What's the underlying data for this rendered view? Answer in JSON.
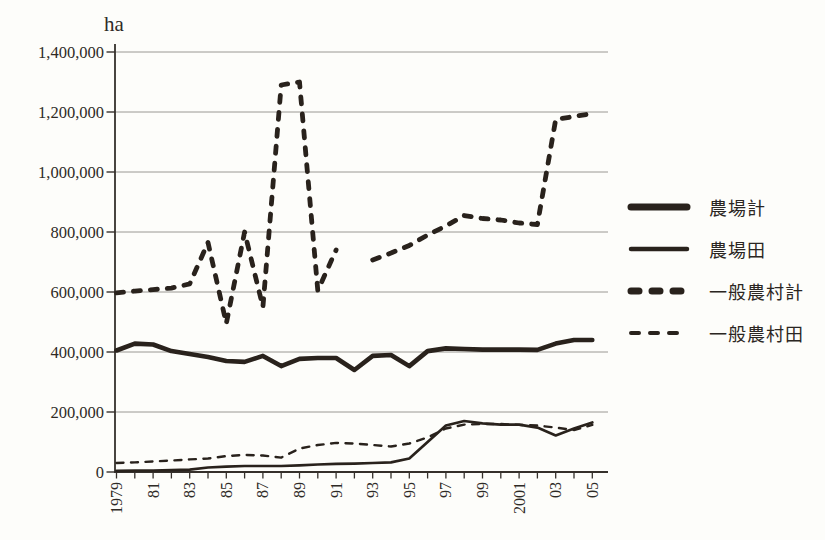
{
  "figure": {
    "unit_label": "ha"
  },
  "colors": {
    "line": "#29221c",
    "grid": "#8f8c88",
    "axis": "#35302b",
    "text": "#2e2a26",
    "background": "#fdfdfa"
  },
  "chart_data": {
    "type": "line",
    "title": "",
    "unit_label": "ha",
    "grid": "horizontal-only",
    "legend_position": "right",
    "ylim": [
      0,
      1400000
    ],
    "x": [
      1979,
      1980,
      1981,
      1982,
      1983,
      1984,
      1985,
      1986,
      1987,
      1988,
      1989,
      1990,
      1991,
      1992,
      1993,
      1994,
      1995,
      1996,
      1997,
      1998,
      1999,
      2000,
      2001,
      2002,
      2003,
      2004,
      2005
    ],
    "x_labeled_ticks": [
      {
        "year": 1979,
        "label": "1979"
      },
      {
        "year": 1981,
        "label": "81"
      },
      {
        "year": 1983,
        "label": "83"
      },
      {
        "year": 1985,
        "label": "85"
      },
      {
        "year": 1987,
        "label": "87"
      },
      {
        "year": 1989,
        "label": "89"
      },
      {
        "year": 1991,
        "label": "91"
      },
      {
        "year": 1993,
        "label": "93"
      },
      {
        "year": 1995,
        "label": "95"
      },
      {
        "year": 1997,
        "label": "97"
      },
      {
        "year": 1999,
        "label": "99"
      },
      {
        "year": 2001,
        "label": "2001"
      },
      {
        "year": 2003,
        "label": "03"
      },
      {
        "year": 2005,
        "label": "05"
      }
    ],
    "y_ticks": [
      {
        "value": 0,
        "label": "0"
      },
      {
        "value": 200000,
        "label": "200,000"
      },
      {
        "value": 400000,
        "label": "400,000"
      },
      {
        "value": 600000,
        "label": "600,000"
      },
      {
        "value": 800000,
        "label": "800,000"
      },
      {
        "value": 1000000,
        "label": "1,000,000"
      },
      {
        "value": 1200000,
        "label": "1,200,000"
      },
      {
        "value": 1400000,
        "label": "1,400,000"
      }
    ],
    "series": [
      {
        "id": "farm-total",
        "name": "農場計",
        "style": "solid-thick",
        "values": [
          405000,
          428000,
          425000,
          403000,
          393000,
          383000,
          370000,
          367000,
          387000,
          353000,
          377000,
          380000,
          380000,
          340000,
          387000,
          390000,
          353000,
          403000,
          412000,
          410000,
          408000,
          408000,
          408000,
          407000,
          428000,
          440000,
          440000
        ]
      },
      {
        "id": "farm-paddy",
        "name": "農場田",
        "style": "solid-thin",
        "values": [
          4000,
          5000,
          5000,
          6000,
          8000,
          15000,
          18000,
          20000,
          20000,
          20000,
          22000,
          25000,
          27000,
          28000,
          30000,
          32000,
          45000,
          100000,
          155000,
          170000,
          162000,
          158000,
          158000,
          148000,
          122000,
          145000,
          165000
        ]
      },
      {
        "id": "village-total",
        "name": "一般農村計",
        "style": "dashed-thick",
        "values": [
          597000,
          603000,
          608000,
          613000,
          627000,
          765000,
          495000,
          800000,
          550000,
          1290000,
          1300000,
          605000,
          740000,
          null,
          707000,
          730000,
          755000,
          790000,
          820000,
          855000,
          845000,
          840000,
          830000,
          825000,
          1175000,
          1185000,
          1195000
        ]
      },
      {
        "id": "village-paddy",
        "name": "一般農村田",
        "style": "dashed-thin",
        "values": [
          30000,
          32000,
          35000,
          38000,
          42000,
          45000,
          53000,
          57000,
          55000,
          48000,
          78000,
          90000,
          97000,
          95000,
          90000,
          85000,
          95000,
          115000,
          145000,
          158000,
          160000,
          160000,
          157000,
          155000,
          148000,
          140000,
          157000
        ]
      }
    ]
  }
}
